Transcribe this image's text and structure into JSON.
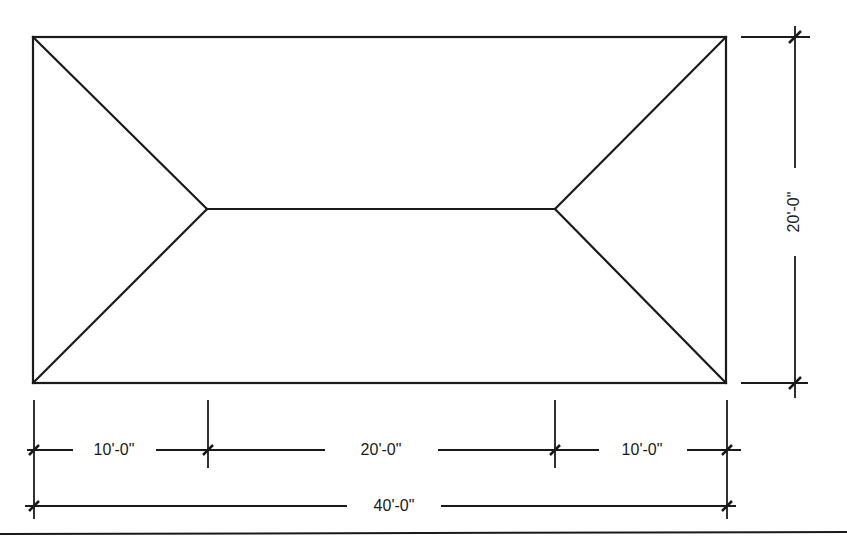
{
  "diagram": {
    "type": "hip-roof-plan",
    "colors": {
      "line": "#1a1a1a",
      "background": "#ffffff"
    },
    "outline": {
      "x1": 33,
      "y1": 37,
      "x2": 726,
      "y2": 383
    },
    "ridge": {
      "x1": 207,
      "y1": 209,
      "x2": 555,
      "y2": 209
    },
    "dimensions": {
      "height": "20'-0\"",
      "left_segment": "10'-0\"",
      "middle_segment": "20'-0\"",
      "right_segment": "10'-0\"",
      "overall_width": "40'-0\""
    }
  }
}
